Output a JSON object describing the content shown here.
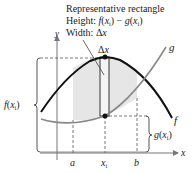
{
  "title": {
    "line1": "Representative rectangle",
    "line2_prefix": "Height: ",
    "line2_expr": "f(x",
    "line3_prefix": "Width: ",
    "line3_expr": "Δx"
  },
  "labels": {
    "delta_x": "Δx",
    "f_curve": "f",
    "g_curve": "g",
    "f_xi": "f(x",
    "g_xi": "g(x",
    "sub_i": "i",
    "close_paren": ")",
    "axis_x": "x",
    "axis_y": "y",
    "tick_a": "a",
    "tick_xi": "x",
    "tick_b": "b",
    "minus": " − g(x"
  },
  "colors": {
    "f_curve": "#111111",
    "g_curve": "#888888",
    "shade": "#e6e6e6",
    "rect_fill": "#f2f2f2",
    "dashed": "#555555",
    "axis": "#777777"
  }
}
